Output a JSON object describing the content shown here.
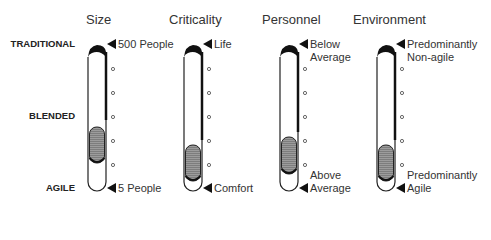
{
  "row_labels": {
    "top": "TRADITIONAL",
    "middle": "BLENDED",
    "bottom": "AGILE"
  },
  "columns": [
    {
      "heading": "Size",
      "top_marker": [
        "500 People"
      ],
      "bottom_marker": [
        "5 People"
      ],
      "fill_range": [
        0.56,
        0.81
      ]
    },
    {
      "heading": "Criticality",
      "top_marker": [
        "Life"
      ],
      "bottom_marker": [
        "Comfort"
      ],
      "fill_range": [
        0.69,
        0.95
      ]
    },
    {
      "heading": "Personnel",
      "top_marker": [
        "Below",
        "Average"
      ],
      "bottom_marker": [
        "Above",
        "Average"
      ],
      "fill_range": [
        0.63,
        0.89
      ]
    },
    {
      "heading": "Environment",
      "top_marker": [
        "Predominantly",
        "Non-agile"
      ],
      "bottom_marker": [
        "Predominantly",
        "Agile"
      ],
      "fill_range": [
        0.69,
        0.94
      ]
    }
  ],
  "colors": {
    "outline": "#222222",
    "fill": "#7a7a7a",
    "fill_stripe": "#9a9a9a",
    "text": "#333333"
  }
}
